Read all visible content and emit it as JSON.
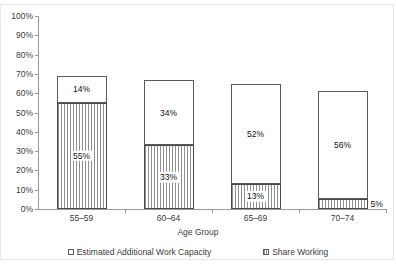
{
  "chart_data": {
    "type": "bar",
    "stacked": true,
    "title": "",
    "subtitle": "",
    "xlabel": "Age Group",
    "ylabel": "",
    "categories": [
      "55–59",
      "60–64",
      "65–69",
      "70–74"
    ],
    "series": [
      {
        "name": "Share Working",
        "values": [
          55,
          33,
          13,
          5
        ],
        "labels": [
          "55%",
          "33%",
          "13%",
          "5%"
        ],
        "swatch": "hatch"
      },
      {
        "name": "Estimated Additional Work Capacity",
        "values": [
          14,
          34,
          52,
          56
        ],
        "labels": [
          "14%",
          "34%",
          "52%",
          "56%"
        ],
        "swatch": "white"
      }
    ],
    "totals": [
      69,
      67,
      65,
      61
    ],
    "ylim": [
      0,
      100
    ],
    "ytick_values": [
      100,
      90,
      80,
      70,
      60,
      50,
      40,
      30,
      20,
      10,
      0
    ],
    "ytick_labels": [
      "100%",
      "90%",
      "80%",
      "70%",
      "60%",
      "50%",
      "40%",
      "30%",
      "20%",
      "10%",
      "0%"
    ],
    "grid": false,
    "legend_position": "bottom"
  },
  "axis": {
    "x_title": "Age Group"
  },
  "legend": {
    "items": [
      {
        "label": "Estimated Additional Work Capacity",
        "swatch": "white"
      },
      {
        "label": "Share Working",
        "swatch": "hatch"
      }
    ]
  },
  "colors": {
    "bar_outline": "#5a5a5a",
    "hatch_stripe": "#8f8f8f",
    "fill_white": "#ffffff",
    "axis": "#9a9a9a",
    "text": "#3b3b3b",
    "frame": "#e8e8e8"
  }
}
